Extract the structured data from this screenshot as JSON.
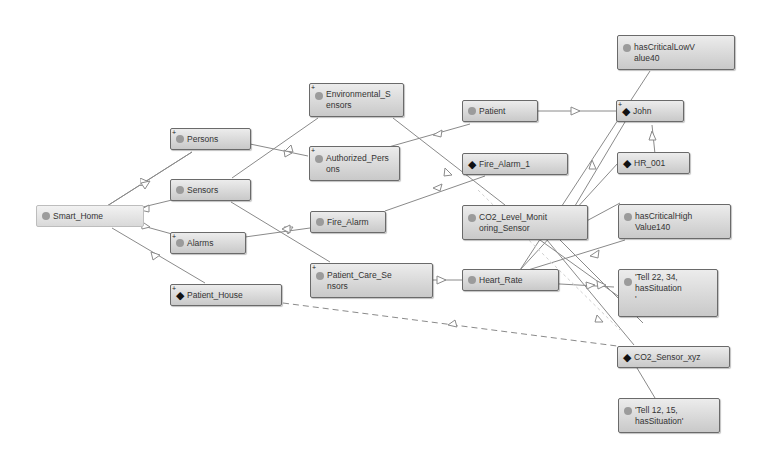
{
  "diagram": {
    "type": "ontology-graph",
    "nodes": [
      {
        "id": "smart_home",
        "label": "Smart_Home",
        "kind": "class",
        "expandable": false
      },
      {
        "id": "persons",
        "label": "Persons",
        "kind": "class",
        "expandable": true
      },
      {
        "id": "sensors",
        "label": "Sensors",
        "kind": "class",
        "expandable": false
      },
      {
        "id": "alarms",
        "label": "Alarms",
        "kind": "class",
        "expandable": true
      },
      {
        "id": "patient_house",
        "label": "Patient_House",
        "kind": "individual",
        "expandable": true
      },
      {
        "id": "environmental_sensors",
        "label": "Environmental_S\nensors",
        "kind": "class",
        "expandable": true
      },
      {
        "id": "authorized_persons",
        "label": "Authorized_Pers\nons",
        "kind": "class",
        "expandable": true
      },
      {
        "id": "fire_alarm",
        "label": "Fire_Alarm",
        "kind": "class",
        "expandable": false
      },
      {
        "id": "patient_care_sensors",
        "label": "Patient_Care_Se\nnsors",
        "kind": "class",
        "expandable": true
      },
      {
        "id": "patient",
        "label": "Patient",
        "kind": "class",
        "expandable": false
      },
      {
        "id": "fire_alarm_1",
        "label": "Fire_Alarm_1",
        "kind": "individual",
        "expandable": false
      },
      {
        "id": "co2_level_monitoring_sensor",
        "label": "CO2_Level_Monit\noring_Sensor",
        "kind": "class",
        "expandable": false
      },
      {
        "id": "heart_rate",
        "label": "Heart_Rate",
        "kind": "class",
        "expandable": false
      },
      {
        "id": "has_critical_low_value40",
        "label": "hasCriticalLowV\nalue40",
        "kind": "class",
        "expandable": false
      },
      {
        "id": "john",
        "label": "John",
        "kind": "individual",
        "expandable": true
      },
      {
        "id": "hr_001",
        "label": "HR_001",
        "kind": "individual",
        "expandable": false
      },
      {
        "id": "has_critical_high_value140",
        "label": "hasCriticalHigh\nValue140",
        "kind": "class",
        "expandable": false
      },
      {
        "id": "tell_22_34",
        "label": "'Tell 22, 34,\nhasSituation\n'",
        "kind": "class",
        "expandable": false
      },
      {
        "id": "co2_sensor_xyz",
        "label": "CO2_Sensor_xyz",
        "kind": "individual",
        "expandable": false
      },
      {
        "id": "tell_12_15",
        "label": "'Tell 12, 15,\nhasSituation'",
        "kind": "class",
        "expandable": false
      }
    ],
    "edges": [
      {
        "from": "smart_home",
        "to": "persons",
        "style": "solid"
      },
      {
        "from": "smart_home",
        "to": "sensors",
        "style": "solid"
      },
      {
        "from": "smart_home",
        "to": "alarms",
        "style": "solid"
      },
      {
        "from": "smart_home",
        "to": "patient_house",
        "style": "solid"
      },
      {
        "from": "persons",
        "to": "authorized_persons",
        "style": "solid"
      },
      {
        "from": "sensors",
        "to": "environmental_sensors",
        "style": "solid"
      },
      {
        "from": "sensors",
        "to": "patient_care_sensors",
        "style": "solid"
      },
      {
        "from": "alarms",
        "to": "fire_alarm",
        "style": "solid"
      },
      {
        "from": "authorized_persons",
        "to": "patient",
        "style": "solid"
      },
      {
        "from": "environmental_sensors",
        "to": "co2_level_monitoring_sensor",
        "style": "solid"
      },
      {
        "from": "fire_alarm",
        "to": "fire_alarm_1",
        "style": "solid"
      },
      {
        "from": "patient_care_sensors",
        "to": "heart_rate",
        "style": "solid"
      },
      {
        "from": "patient",
        "to": "john",
        "style": "solid"
      },
      {
        "from": "hr_001",
        "to": "john",
        "style": "solid"
      },
      {
        "from": "co2_sensor_xyz",
        "to": "patient_house",
        "style": "dashed"
      }
    ],
    "legend": {
      "class_icon": "gray-circle",
      "individual_icon": "black-diamond",
      "expand_marker": "+"
    }
  }
}
